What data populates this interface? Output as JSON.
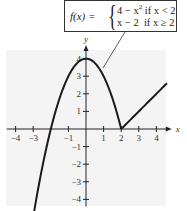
{
  "chart_data": {
    "type": "line",
    "title": "",
    "function_label": "f(x) =",
    "pieces": [
      {
        "expr": "4 − x²",
        "condition": "if x < 2",
        "formula": "4 - x^2",
        "domain": [
          -3.6,
          2
        ]
      },
      {
        "expr": "x − 2",
        "condition": "if x ≥ 2",
        "formula": "x - 2",
        "domain": [
          2,
          4.6
        ]
      }
    ],
    "xlabel": "x",
    "ylabel": "y",
    "x_ticks": [
      -4,
      -3,
      -1,
      1,
      2,
      3,
      4
    ],
    "y_ticks": [
      -4,
      -3,
      -2,
      -1,
      1,
      2,
      3,
      4
    ],
    "xlim": [
      -4.5,
      4.7
    ],
    "ylim": [
      -4.4,
      4.6
    ],
    "grid": false,
    "background": "#f4f4f4",
    "line_color": "#1a1a1a"
  },
  "formula": {
    "lhs": "f(x) =",
    "case1_expr": "4 − x",
    "case1_sup": "2",
    "case1_cond": " if x < 2",
    "case2_expr": "x − 2",
    "case2_cond": "  if x ≥ 2"
  }
}
